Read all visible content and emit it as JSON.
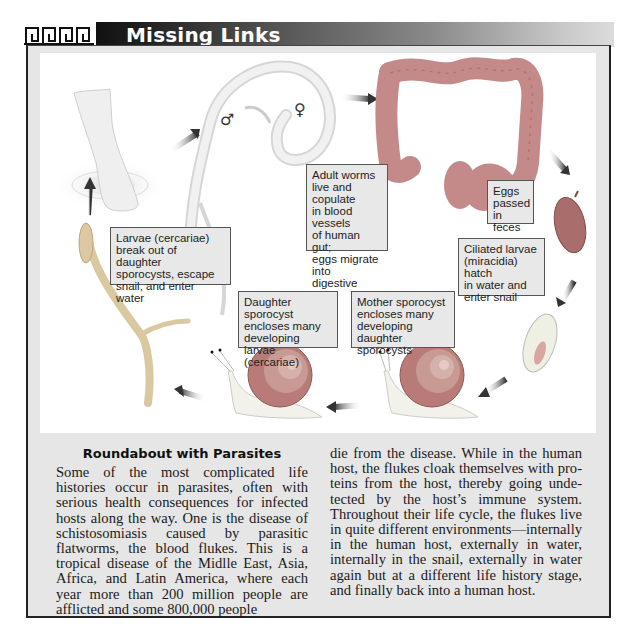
{
  "header": {
    "title": "Missing Links",
    "ornament": "greek-meander-ornament"
  },
  "diagram": {
    "stages": [
      {
        "id": "human-foot",
        "icon": "human-foot-in-water-icon"
      },
      {
        "id": "adult-worms",
        "icon": "paired-worms-icon",
        "symbols": {
          "male": "♂",
          "female": "♀"
        }
      },
      {
        "id": "human-gut",
        "icon": "large-intestine-icon"
      },
      {
        "id": "egg",
        "icon": "egg-icon"
      },
      {
        "id": "miracidium",
        "icon": "ciliated-larva-icon"
      },
      {
        "id": "snail-mother",
        "icon": "snail-icon"
      },
      {
        "id": "snail-daughter",
        "icon": "snail-icon"
      },
      {
        "id": "cercaria",
        "icon": "cercaria-forked-tail-icon"
      }
    ],
    "labels": {
      "adult_worms": "Adult worms\nlive and copulate\nin blood vessels\nof human gut;\neggs migrate into\ndigestive tract",
      "eggs": "Eggs\npassed\nin feces",
      "miracidia": "Ciliated larvae\n(miracidia) hatch\nin water and\nenter snail",
      "mother_sporocyst": "Mother sporocyst\nencloses many\ndeveloping daughter\nsporocysts",
      "daughter_sporocyst": "Daughter sporocyst\nencloses many\ndeveloping\nlarvae (cercariae)",
      "cercariae": "Larvae (cercariae)\nbreak out of daughter\nsporocysts, escape\nsnail, and enter water"
    }
  },
  "article": {
    "title": "Roundabout with Parasites",
    "col1": "Some of the most complicated life histories occur in parasites, often with serious health consequences for infected hosts along the way. One is the disease of schistosomiasis caused by parasitic flatworms, the blood flukes. This is a tropical disease of the Mid­lle East, Asia, Africa, and Latin America, where each year more than 200 million peo­ple are afflicted and some 800,000 people",
    "col2": "die from the disease. While in the human host, the flukes cloak themselves with pro­teins from the host, thereby going unde­tected by the host’s immune system. Throughout their life cycle, the flukes live in quite different environments—internally in the human host, externally in water, inter­nally in the snail, externally in water again but at a different life history stage, and fi­nally back into a human host."
  },
  "colors": {
    "frame_bg": "#e6e6e6",
    "panel_bg": "#ffffff",
    "label_bg": "#e8e8e8",
    "title_bar_dark": "#111111",
    "organ_pink": "#c48a8a",
    "snail_shell": "#b87b78"
  }
}
